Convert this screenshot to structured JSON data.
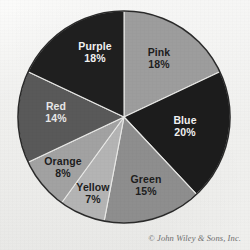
{
  "chart_data": {
    "type": "pie",
    "title": "",
    "subtitle": "",
    "xlabel": "",
    "ylabel": "",
    "legend_position": "none",
    "grid": false,
    "labels_inside_slices": true,
    "start_angle_deg": 0,
    "direction": "clockwise",
    "categories": [
      "Pink",
      "Blue",
      "Green",
      "Yellow",
      "Orange",
      "Red",
      "Purple"
    ],
    "values": [
      18,
      20,
      15,
      7,
      8,
      14,
      18
    ],
    "value_unit": "%",
    "slices": [
      {
        "name": "Pink",
        "label": "Pink",
        "value": 18,
        "value_label": "18%",
        "angle_deg": 64.8,
        "fill": "#9d9d9d",
        "text_color": "#1d1d1d",
        "label_x": 159,
        "label_y": 56,
        "value_x": 159,
        "value_y": 68
      },
      {
        "name": "Blue",
        "label": "Blue",
        "value": 20,
        "value_label": "20%",
        "angle_deg": 72.0,
        "fill": "#1c1c1c",
        "text_color": "#f2f2f2",
        "label_x": 185,
        "label_y": 124,
        "value_x": 185,
        "value_y": 136
      },
      {
        "name": "Green",
        "label": "Green",
        "value": 15,
        "value_label": "15%",
        "angle_deg": 54.0,
        "fill": "#8e8e8e",
        "text_color": "#1d1d1d",
        "label_x": 146,
        "label_y": 183,
        "value_x": 146,
        "value_y": 195
      },
      {
        "name": "Yellow",
        "label": "Yellow",
        "value": 7,
        "value_label": "7%",
        "angle_deg": 25.2,
        "fill": "#b4b4b4",
        "text_color": "#1d1d1d",
        "label_x": 93,
        "label_y": 191,
        "value_x": 93,
        "value_y": 203
      },
      {
        "name": "Orange",
        "label": "Orange",
        "value": 8,
        "value_label": "8%",
        "angle_deg": 28.8,
        "fill": "#a2a2a2",
        "text_color": "#1d1d1d",
        "label_x": 63,
        "label_y": 165,
        "value_x": 63,
        "value_y": 177
      },
      {
        "name": "Red",
        "label": "Red",
        "value": 14,
        "value_label": "14%",
        "angle_deg": 50.4,
        "fill": "#595959",
        "text_color": "#e8e8e8",
        "label_x": 56,
        "label_y": 110,
        "value_x": 56,
        "value_y": 122
      },
      {
        "name": "Purple",
        "label": "Purple",
        "value": 18,
        "value_label": "18%",
        "angle_deg": 64.8,
        "fill": "#1f1f1f",
        "text_color": "#f2f2f2",
        "label_x": 95,
        "label_y": 50,
        "value_x": 95,
        "value_y": 62
      }
    ],
    "geometry": {
      "center_x": 124,
      "center_y": 117,
      "radius": 106
    },
    "colors": {
      "background": "#f4f4f2",
      "outline": "#2a2a2a",
      "slice_divider": "#e9e9e7"
    }
  },
  "credit": {
    "text": "© John Wiley & Sons, Inc."
  }
}
